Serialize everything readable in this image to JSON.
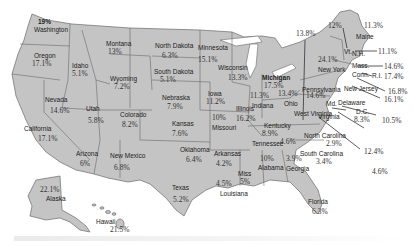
{
  "map": {
    "type": "choropleth-labels",
    "title": "",
    "states": [
      {
        "name": "Washington",
        "value": "19%"
      },
      {
        "name": "Oregon",
        "value": "17.1%"
      },
      {
        "name": "California",
        "value": "17.1%"
      },
      {
        "name": "Nevada",
        "value": "14.6%"
      },
      {
        "name": "Idaho",
        "value": "5.1%"
      },
      {
        "name": "Montana",
        "value": "13%"
      },
      {
        "name": "Wyoming",
        "value": "7.2%"
      },
      {
        "name": "Utah",
        "value": "5.8%"
      },
      {
        "name": "Colorado",
        "value": "8.2%"
      },
      {
        "name": "Arizona",
        "value": "6%"
      },
      {
        "name": "New Mexico",
        "value": "6.8%"
      },
      {
        "name": "North Dakota",
        "value": "6.3%"
      },
      {
        "name": "South Dakota",
        "value": "5.1%"
      },
      {
        "name": "Nebraska",
        "value": "7.9%"
      },
      {
        "name": "Kansas",
        "value": "7.6%"
      },
      {
        "name": "Oklahoma",
        "value": "6.4%"
      },
      {
        "name": "Texas",
        "value": "5.2%"
      },
      {
        "name": "Minnesota",
        "value": "15.1%"
      },
      {
        "name": "Iowa",
        "value": "11.2%"
      },
      {
        "name": "Missouri",
        "value": "10%"
      },
      {
        "name": "Arkansas",
        "value": "4.2%"
      },
      {
        "name": "Louisiana",
        "value": "4.5%"
      },
      {
        "name": "Wisconsin",
        "value": "13.3%"
      },
      {
        "name": "Illinois",
        "value": "16.2%"
      },
      {
        "name": "Michigan",
        "value": "17.5%"
      },
      {
        "name": "Indiana",
        "value": "11.3%"
      },
      {
        "name": "Ohio",
        "value": "13.4%"
      },
      {
        "name": "Kentucky",
        "value": "8.9%"
      },
      {
        "name": "Tennessee",
        "value": "4.6%"
      },
      {
        "name": "Miss",
        "value": "5%"
      },
      {
        "name": "Alabama",
        "value": "10%"
      },
      {
        "name": "Georgia",
        "value": "3.9%"
      },
      {
        "name": "Florida",
        "value": "6.3%"
      },
      {
        "name": "South Carolina",
        "value": "3.4%"
      },
      {
        "name": "North Carolina",
        "value": "2.9%"
      },
      {
        "name": "Virginia",
        "value": "12.4%"
      },
      {
        "name": "West Virginia",
        "value": "13.8%"
      },
      {
        "name": "Pennsylvania",
        "value": "14.6%"
      },
      {
        "name": "New York",
        "value": "24.1%"
      },
      {
        "name": "Vt.",
        "value": "12%"
      },
      {
        "name": "Maine",
        "value": "11.3%"
      },
      {
        "name": "N.H.",
        "value": "11.1%"
      },
      {
        "name": "Mass.",
        "value": "14.6%"
      },
      {
        "name": "R.I.",
        "value": "17.4%"
      },
      {
        "name": "Conn.",
        "value": "16.8%"
      },
      {
        "name": "New Jersey",
        "value": "16.1%"
      },
      {
        "name": "Delaware",
        "value": "10.5%"
      },
      {
        "name": "Md.",
        "value": "4.6%"
      },
      {
        "name": "D.C.",
        "value": "8.3%"
      },
      {
        "name": "Alaska",
        "value": "22.1%"
      },
      {
        "name": "Hawaii",
        "value": "21.5%"
      }
    ]
  },
  "labels": {
    "wa": "Washington",
    "wa_v": "19%",
    "or": "Oregon",
    "or_v": "17.1%",
    "ca": "California",
    "ca_v": "17.1%",
    "nv": "Nevada",
    "nv_v": "14.6%",
    "id": "Idaho",
    "id_v": "5.1%",
    "mt": "Montana",
    "mt_v": "13%",
    "wy": "Wyoming",
    "wy_v": "7.2%",
    "ut": "Utah",
    "ut_v": "5.8%",
    "co": "Colorado",
    "co_v": "8.2%",
    "az": "Arizona",
    "az_v": "6%",
    "nm": "New Mexico",
    "nm_v": "6.8%",
    "nd": "North Dakota",
    "nd_v": "6.3%",
    "sd": "South Dakota",
    "sd_v": "5.1%",
    "ne": "Nebraska",
    "ne_v": "7.9%",
    "ks": "Kansas",
    "ks_v": "7.6%",
    "ok": "Oklahoma",
    "ok_v": "6.4%",
    "tx": "Texas",
    "tx_v": "5.2%",
    "mn": "Minnesota",
    "mn_v": "15.1%",
    "ia": "Iowa",
    "ia_v": "11.2%",
    "mo": "Missouri",
    "mo_v": "10%",
    "ar": "Arkansas",
    "ar_v": "4.2%",
    "la": "Louisiana",
    "la_v": "4.5%",
    "wi": "Wisconsin",
    "wi_v": "13.3%",
    "il": "Illinois",
    "il_v": "16.2%",
    "mi": "Michigan",
    "mi_v": "17.5%",
    "in": "Indiana",
    "in_v": "11.3%",
    "oh": "Ohio",
    "oh_v": "13.4%",
    "ky": "Kentucky",
    "ky_v": "8.9%",
    "tn": "Tennessee",
    "tn_v": "4.6%",
    "ms": "Miss",
    "ms_v": "5%",
    "al": "Alabama",
    "al_v": "10%",
    "ga": "Georgia",
    "ga_v": "3.9%",
    "fl": "Florida",
    "fl_v": "6.3%",
    "sc": "South Carolina",
    "sc_v": "3.4%",
    "nc": "North Carolina",
    "nc_v": "2.9%",
    "va": "Virginia",
    "va_v": "12.4%",
    "wv": "West Virginia",
    "wv_v": "13.8%",
    "pa": "Pennsylvania",
    "pa_v": "14.6%",
    "ny": "New York",
    "ny_v": "24.1%",
    "vt": "Vt.",
    "vt_v": "12%",
    "me": "Maine",
    "me_v": "11.3%",
    "nh": "N.H.",
    "nh_v": "11.1%",
    "ma": "Mass.",
    "ma_v": "14.6%",
    "ri": "R.I.",
    "ri_v": "17.4%",
    "ct": "Conn.",
    "ct_v": "16.8%",
    "nj": "New Jersey",
    "nj_v": "16.1%",
    "de": "Delaware",
    "de_v": "10.5%",
    "md": "Md.",
    "md_v": "4.6%",
    "dc": "D.C.",
    "dc_v": "8.3%",
    "ak": "Alaska",
    "ak_v": "22.1%",
    "hi": "Hawaii",
    "hi_v": "21.5%"
  },
  "colors": {
    "state_fill": "#c4c4c4",
    "border": "#6a6a6a",
    "text": "#222222",
    "background": "#ffffff"
  }
}
